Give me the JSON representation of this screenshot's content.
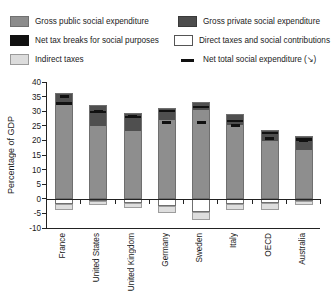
{
  "legend": {
    "items": [
      {
        "key": "gross-public",
        "label": "Gross public social expenditure",
        "swatch": "sw-pub",
        "col": 1
      },
      {
        "key": "gross-private",
        "label": "Gross private social expenditure",
        "swatch": "sw-priv",
        "col": 2
      },
      {
        "key": "net-tax-breaks",
        "label": "Net tax breaks for social purposes",
        "swatch": "sw-black",
        "col": 1
      },
      {
        "key": "direct-taxes",
        "label": "Direct taxes and social contributions",
        "swatch": "sw-direct",
        "col": 2
      },
      {
        "key": "indirect-taxes",
        "label": "Indirect taxes",
        "swatch": "sw-indirect",
        "col": 1
      },
      {
        "key": "net-total",
        "label": "Net total social expenditure (↘)",
        "swatch": "sw-dash",
        "col": 2
      }
    ]
  },
  "chart_data": {
    "type": "bar",
    "title": "",
    "xlabel": "",
    "ylabel": "Percentage of GDP",
    "ylim": [
      -10,
      40
    ],
    "yticks": [
      40,
      35,
      30,
      25,
      20,
      15,
      10,
      5,
      0,
      -5,
      -10
    ],
    "grid": false,
    "legend_position": "top",
    "stacked": true,
    "categories": [
      "France",
      "United States",
      "United Kingdom",
      "Germany",
      "Sweden",
      "Italy",
      "OECD",
      "Australia"
    ],
    "series": [
      {
        "name": "Gross public social expenditure",
        "values": [
          32.0,
          24.5,
          23.0,
          26.5,
          30.0,
          25.0,
          19.5,
          16.5
        ]
      },
      {
        "name": "Gross private social expenditure",
        "values": [
          4.2,
          7.7,
          6.5,
          4.5,
          3.0,
          4.0,
          4.0,
          5.0
        ]
      },
      {
        "name": "Direct taxes and social contributions",
        "values": [
          -1.7,
          -0.8,
          -1.5,
          -2.5,
          -4.5,
          -1.8,
          -1.6,
          -0.6
        ]
      },
      {
        "name": "Indirect taxes",
        "values": [
          -2.3,
          -1.4,
          -1.7,
          -2.5,
          -2.7,
          -2.0,
          -2.2,
          -1.5
        ]
      }
    ],
    "net_tax_breaks_band": [
      [
        32.6,
        33.6
      ],
      [
        29.6,
        30.4
      ],
      [
        28.0,
        28.8
      ],
      [
        30.0,
        30.8
      ],
      [
        31.3,
        32.1
      ],
      [
        26.5,
        27.3
      ],
      [
        22.4,
        23.2
      ],
      [
        20.2,
        21.0
      ]
    ],
    "net_total_markers": [
      35.3,
      30.4,
      28.4,
      26.6,
      26.5,
      25.4,
      21.0,
      20.3
    ],
    "bar_tops": [
      36.2,
      32.2,
      29.5,
      31.0,
      33.0,
      29.0,
      23.5,
      21.5
    ]
  }
}
